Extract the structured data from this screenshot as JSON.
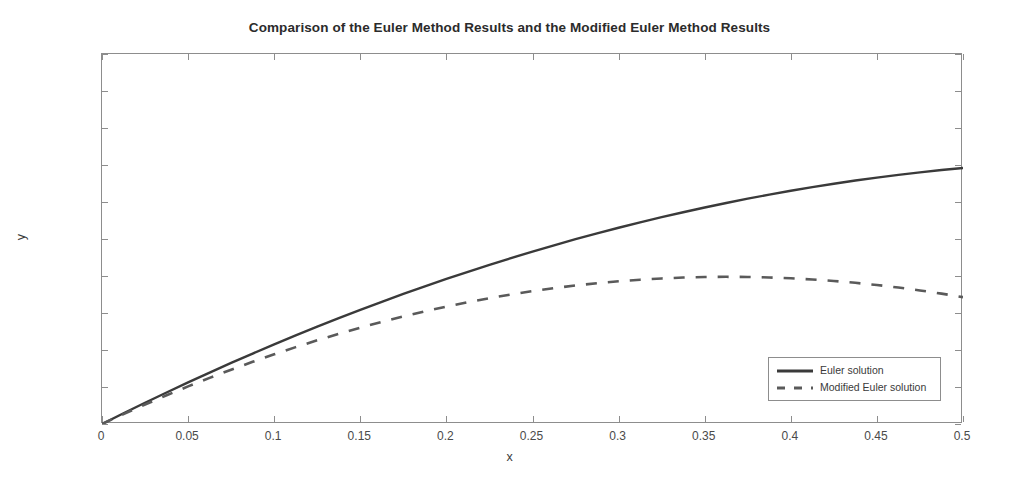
{
  "chart_data": {
    "type": "line",
    "title": "Comparison of the Euler Method Results and the Modified Euler Method Results",
    "xlabel": "x",
    "ylabel": "y",
    "xlim": [
      0,
      0.5
    ],
    "ylim": [
      -1.5,
      -1
    ],
    "grid": false,
    "legend_position": "lower right",
    "xticks": [
      "0",
      "0.05",
      "0.1",
      "0.15",
      "0.2",
      "0.25",
      "0.3",
      "0.35",
      "0.4",
      "0.45",
      "0.5"
    ],
    "xtick_values": [
      0,
      0.05,
      0.1,
      0.15,
      0.2,
      0.25,
      0.3,
      0.35,
      0.4,
      0.45,
      0.5
    ],
    "yticks": [
      "-1",
      "-1.05",
      "-1.1",
      "-1.15",
      "-1.2",
      "-1.25",
      "-1.3",
      "-1.35",
      "-1.4",
      "-1.45",
      "-1.5"
    ],
    "ytick_values": [
      -1,
      -1.05,
      -1.1,
      -1.15,
      -1.2,
      -1.25,
      -1.3,
      -1.35,
      -1.4,
      -1.45,
      -1.5
    ],
    "x": [
      0,
      0.0125,
      0.025,
      0.0375,
      0.05,
      0.0625,
      0.075,
      0.0875,
      0.1,
      0.1125,
      0.125,
      0.1375,
      0.15,
      0.1625,
      0.175,
      0.1875,
      0.2,
      0.2125,
      0.225,
      0.2375,
      0.25,
      0.2625,
      0.275,
      0.2875,
      0.3,
      0.3125,
      0.325,
      0.3375,
      0.35,
      0.3625,
      0.375,
      0.3875,
      0.4,
      0.4125,
      0.425,
      0.4375,
      0.45,
      0.4625,
      0.475,
      0.4875,
      0.5
    ],
    "series": [
      {
        "name": "Euler solution",
        "style": "solid",
        "color": "#3a3a3a",
        "values": [
          -1.5,
          -1.4855,
          -1.4713,
          -1.4574,
          -1.4438,
          -1.4305,
          -1.4175,
          -1.4048,
          -1.3924,
          -1.3803,
          -1.3685,
          -1.357,
          -1.3458,
          -1.3349,
          -1.3243,
          -1.314,
          -1.304,
          -1.2943,
          -1.2849,
          -1.2758,
          -1.267,
          -1.2585,
          -1.2503,
          -1.2424,
          -1.2348,
          -1.2275,
          -1.2205,
          -1.2138,
          -1.2074,
          -1.2013,
          -1.1955,
          -1.19,
          -1.1848,
          -1.1799,
          -1.1753,
          -1.171,
          -1.167,
          -1.1633,
          -1.1599,
          -1.1568,
          -1.154
        ]
      },
      {
        "name": "Modified Euler solution",
        "style": "dashed",
        "color": "#5a5a5a",
        "values": [
          -1.5,
          -1.4866,
          -1.4737,
          -1.4612,
          -1.4492,
          -1.4377,
          -1.4266,
          -1.416,
          -1.4058,
          -1.3961,
          -1.3869,
          -1.3781,
          -1.3698,
          -1.362,
          -1.3546,
          -1.3477,
          -1.3413,
          -1.3354,
          -1.3299,
          -1.3249,
          -1.3204,
          -1.3164,
          -1.3128,
          -1.3097,
          -1.3071,
          -1.305,
          -1.3033,
          -1.3021,
          -1.3014,
          -1.3011,
          -1.3013,
          -1.302,
          -1.3031,
          -1.3047,
          -1.3067,
          -1.3092,
          -1.3122,
          -1.3156,
          -1.3195,
          -1.3238,
          -1.3286
        ]
      }
    ],
    "annotations": {
      "euler_end_value": -1.04,
      "modified_euler_peak_value": -1.207,
      "modified_euler_peak_x": 0.42,
      "modified_euler_end_value": -1.215,
      "start_value": -1.5
    }
  },
  "legend": {
    "entries": [
      {
        "label": "Euler solution"
      },
      {
        "label": "Modified Euler solution"
      }
    ]
  }
}
